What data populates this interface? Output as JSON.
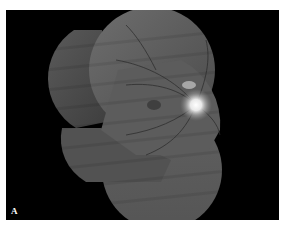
{
  "figure": {
    "panel_label": "A",
    "background_color": "#000000",
    "border_color": "#ffffff"
  }
}
